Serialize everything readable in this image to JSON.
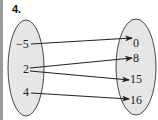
{
  "problem": {
    "number": "4."
  },
  "colors": {
    "ellipse_fill": "#e6e6e6",
    "stroke": "#222222",
    "edge_strip": "#9a9a9a"
  },
  "domain": {
    "values": [
      "−5",
      "2",
      "4"
    ]
  },
  "range": {
    "values": [
      "0",
      "8",
      "15",
      "16"
    ]
  },
  "mappings": [
    {
      "from": "−5",
      "to": "0"
    },
    {
      "from": "2",
      "to": "8"
    },
    {
      "from": "2",
      "to": "15"
    },
    {
      "from": "4",
      "to": "16"
    }
  ]
}
